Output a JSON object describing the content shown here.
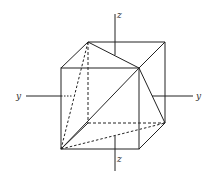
{
  "diagram": {
    "type": "cube-with-inscribed-triangle",
    "axes": {
      "z_top_label": "z",
      "z_bottom_label": "z",
      "y_left_label": "y",
      "y_right_label": "y"
    },
    "vertices": {
      "front_top_left": [
        61,
        68
      ],
      "front_top_right": [
        139,
        68
      ],
      "front_bottom_left": [
        61,
        149
      ],
      "front_bottom_right": [
        139,
        149
      ],
      "back_top_left": [
        88,
        42
      ],
      "back_top_right": [
        165,
        42
      ],
      "back_bottom_left": [
        88,
        123
      ],
      "back_bottom_right": [
        165,
        123
      ]
    },
    "stroke_color": "#222222"
  }
}
